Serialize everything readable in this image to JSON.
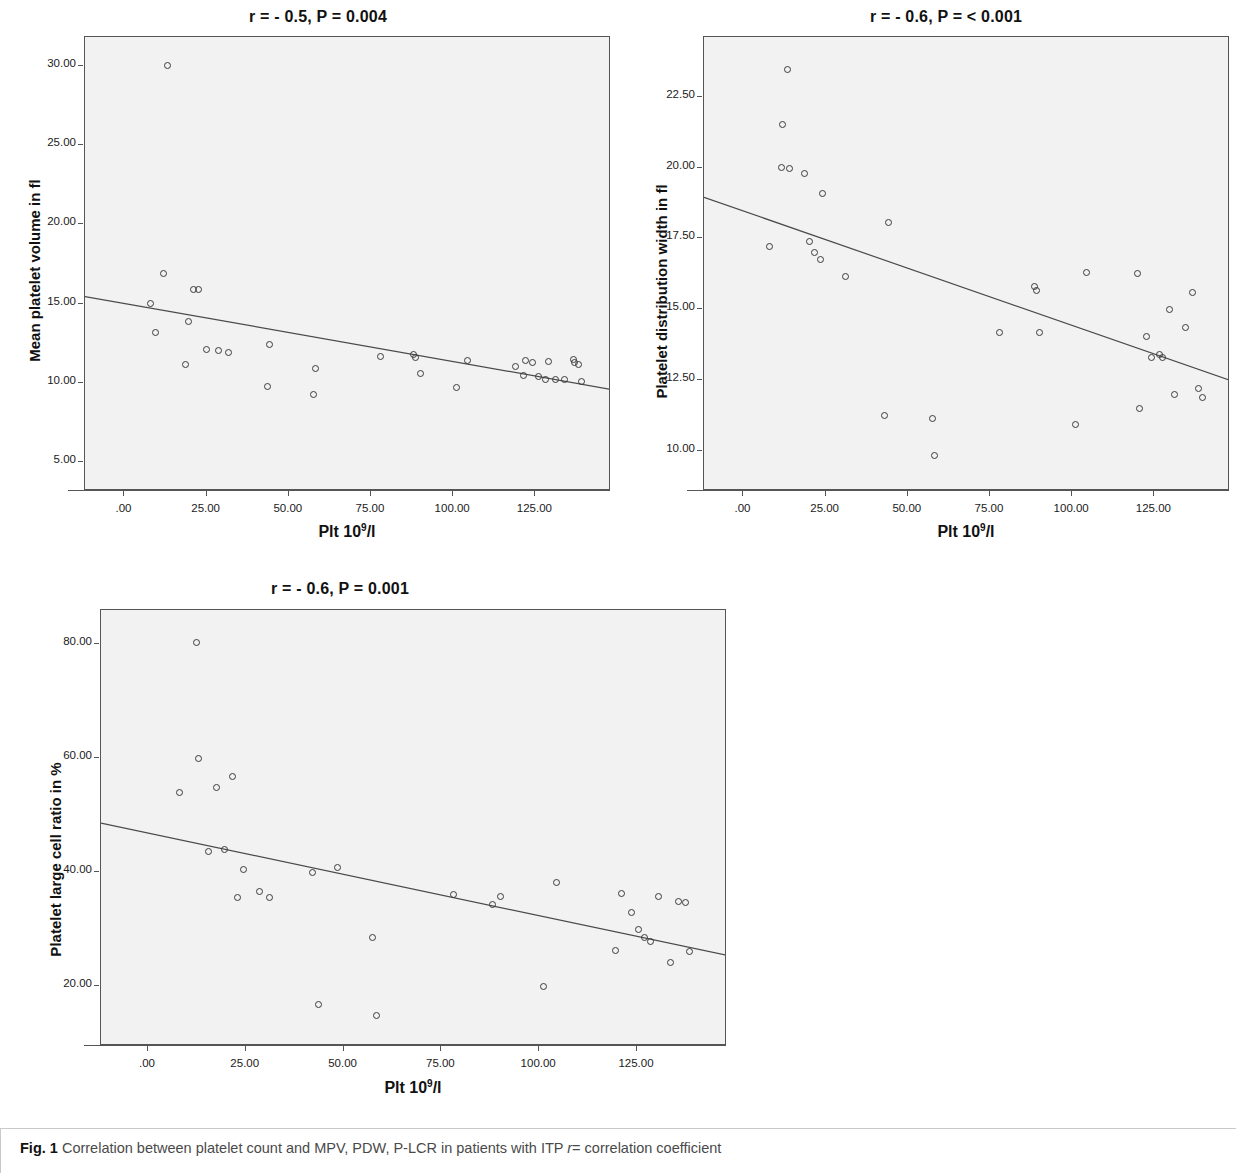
{
  "figure": {
    "caption_bold": "Fig. 1",
    "caption_text": "Correlation between platelet count and MPV, PDW, P-LCR in patients with ITP",
    "caption_italic": "r",
    "caption_tail": "= correlation coefficient"
  },
  "axis_common": {
    "xlabel_prefix": "Plt  10",
    "xlabel_sup": "9",
    "xlabel_suffix": "/l"
  },
  "chart_data": [
    {
      "id": "mpv",
      "type": "scatter",
      "title": "r = - 0.5, P = 0.004",
      "r": -0.5,
      "p_value": "0.004",
      "xlabel": "Plt  10⁹/l",
      "ylabel": "Mean platelet volume in fl",
      "xlim": [
        -12,
        148
      ],
      "ylim": [
        3.2,
        31.8
      ],
      "xticks": [
        0,
        25,
        50,
        75,
        100,
        125
      ],
      "xticklabels": [
        ".00",
        "25.00",
        "50.00",
        "75.00",
        "100.00",
        "125.00"
      ],
      "yticks": [
        5,
        10,
        15,
        20,
        25,
        30
      ],
      "yticklabels": [
        "5.00",
        "10.00",
        "15.00",
        "20.00",
        "25.00",
        "30.00"
      ],
      "grid": false,
      "legend": "none",
      "fit_line": {
        "x0": -12,
        "y0": 15.45,
        "x1": 148,
        "y1": 9.6
      },
      "x": [
        13.0,
        8.0,
        9.5,
        12.0,
        18.5,
        21.0,
        22.5,
        19.5,
        25.0,
        28.5,
        31.5,
        43.5,
        44.0,
        57.5,
        58.0,
        78.0,
        88.0,
        88.5,
        90.0,
        101.0,
        104.5,
        119.0,
        121.5,
        122.0,
        124.0,
        126.0,
        128.0,
        129.0,
        131.0,
        134.0,
        136.5,
        137.0,
        138.0,
        139.0
      ],
      "y": [
        30.0,
        15.0,
        13.2,
        16.9,
        11.2,
        15.9,
        15.9,
        13.9,
        12.1,
        12.05,
        11.95,
        9.8,
        12.4,
        9.25,
        10.9,
        11.65,
        11.8,
        11.6,
        10.6,
        9.75,
        11.4,
        11.05,
        10.5,
        11.4,
        11.3,
        10.4,
        10.2,
        11.35,
        10.2,
        10.2,
        11.5,
        11.3,
        11.2,
        10.1
      ]
    },
    {
      "id": "pdw",
      "type": "scatter",
      "title": "r = - 0.6, P = < 0.001",
      "r": -0.6,
      "p_value": "< 0.001",
      "xlabel": "Plt  10⁹/l",
      "ylabel": "Platelet distribution width in fl",
      "xlim": [
        -12,
        148
      ],
      "ylim": [
        8.6,
        24.6
      ],
      "xticks": [
        0,
        25,
        50,
        75,
        100,
        125
      ],
      "xticklabels": [
        ".00",
        "25.00",
        "50.00",
        "75.00",
        "100.00",
        "125.00"
      ],
      "yticks": [
        10,
        12.5,
        15,
        17.5,
        20,
        22.5
      ],
      "yticklabels": [
        "10.00",
        "12.50",
        "15.00",
        "17.50",
        "20.00",
        "22.50"
      ],
      "grid": false,
      "legend": "none",
      "fit_line": {
        "x0": -12,
        "y0": 18.95,
        "x1": 148,
        "y1": 12.5
      },
      "x": [
        13.5,
        12.0,
        8.0,
        11.5,
        14.0,
        18.5,
        20.0,
        21.5,
        23.5,
        24.0,
        31.0,
        43.0,
        44.0,
        57.5,
        58.0,
        78.0,
        88.5,
        89.0,
        90.0,
        101.0,
        104.5,
        120.0,
        120.5,
        122.5,
        124.0,
        126.5,
        127.5,
        129.5,
        131.0,
        134.5,
        136.5,
        138.5,
        139.5
      ],
      "y": [
        23.45,
        21.5,
        17.2,
        20.0,
        19.95,
        19.8,
        17.4,
        17.0,
        16.75,
        19.1,
        16.15,
        11.25,
        18.05,
        11.15,
        9.85,
        14.2,
        15.8,
        15.65,
        14.2,
        10.95,
        16.3,
        16.25,
        11.5,
        14.05,
        13.3,
        13.4,
        13.3,
        15.0,
        12.0,
        14.35,
        15.6,
        12.2,
        11.9
      ]
    },
    {
      "id": "plcr",
      "type": "scatter",
      "title": "r = - 0.6, P = 0.001",
      "r": -0.6,
      "p_value": "0.001",
      "xlabel": "Plt  10⁹/l",
      "ylabel": "Platelet large cell ratio in %",
      "xlim": [
        -12,
        148
      ],
      "ylim": [
        9.5,
        86.0
      ],
      "xticks": [
        0,
        25,
        50,
        75,
        100,
        125
      ],
      "xticklabels": [
        ".00",
        "25.00",
        "50.00",
        "75.00",
        "100.00",
        "125.00"
      ],
      "yticks": [
        20,
        40,
        60,
        80
      ],
      "yticklabels": [
        "20.00",
        "40.00",
        "60.00",
        "80.00"
      ],
      "grid": false,
      "legend": "none",
      "fit_line": {
        "x0": -12,
        "y0": 48.6,
        "x1": 148,
        "y1": 25.4
      },
      "x": [
        12.5,
        8.0,
        13.0,
        15.5,
        17.5,
        19.5,
        21.5,
        23.0,
        24.5,
        28.5,
        31.0,
        42.0,
        43.5,
        48.5,
        57.5,
        58.5,
        78.0,
        88.0,
        90.0,
        101.0,
        104.5,
        119.5,
        121.0,
        123.5,
        125.5,
        127.0,
        128.5,
        130.5,
        133.5,
        135.5,
        137.5,
        138.5
      ],
      "y": [
        80.3,
        53.9,
        60.0,
        43.6,
        54.9,
        43.9,
        56.8,
        35.5,
        40.4,
        36.6,
        35.6,
        40.0,
        16.7,
        40.9,
        28.6,
        14.8,
        36.0,
        34.3,
        35.8,
        20.0,
        38.2,
        26.3,
        36.2,
        33.0,
        30.0,
        28.6,
        27.8,
        35.8,
        24.2,
        34.8,
        34.6,
        26.0
      ]
    }
  ]
}
